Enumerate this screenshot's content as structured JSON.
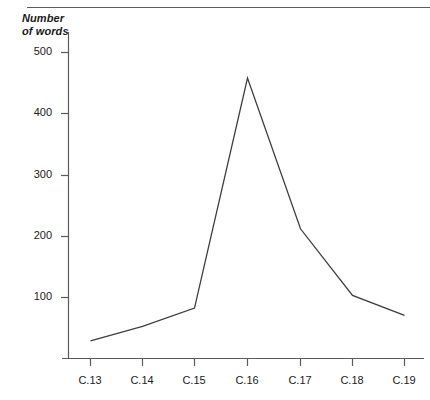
{
  "figure": {
    "name": "number-of-words-line-chart",
    "axis_title_line1": "Number",
    "axis_title_line2": "of words",
    "line_color": "#3d3d3d",
    "axis_color": "#5a5a5a",
    "background": "#ffffff"
  },
  "chart_data": {
    "type": "line",
    "title": "",
    "subtitle": "",
    "xlabel": "",
    "ylabel": "Number of words",
    "categories": [
      "C.13",
      "C.14",
      "C.15",
      "C.16",
      "C.17",
      "C.18",
      "C.19"
    ],
    "values": [
      30,
      54,
      84,
      464,
      215,
      105,
      72
    ],
    "series": [
      {
        "name": "Number of words",
        "values": [
          30,
          54,
          84,
          464,
          215,
          105,
          72
        ]
      }
    ],
    "ylim": [
      0,
      540
    ],
    "xtick_labels": [
      "C.13",
      "C.14",
      "C.15",
      "C.16",
      "C.17",
      "C.18",
      "C.19"
    ],
    "ytick_labels": [
      "100",
      "200",
      "300",
      "400",
      "500"
    ],
    "ytick_values": [
      100,
      200,
      300,
      400,
      500
    ],
    "grid": false,
    "legend": false,
    "legend_position": "none",
    "markers": false,
    "annotations": []
  },
  "ticks": {
    "y": [
      {
        "label": "500",
        "value": 500
      },
      {
        "label": "400",
        "value": 400
      },
      {
        "label": "300",
        "value": 300
      },
      {
        "label": "200",
        "value": 200
      },
      {
        "label": "100",
        "value": 100
      }
    ],
    "x": [
      {
        "label": "C.13"
      },
      {
        "label": "C.14"
      },
      {
        "label": "C.15"
      },
      {
        "label": "C.16"
      },
      {
        "label": "C.17"
      },
      {
        "label": "C.18"
      },
      {
        "label": "C.19"
      }
    ]
  }
}
